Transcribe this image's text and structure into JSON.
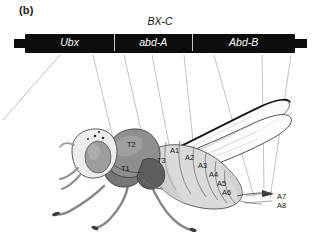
{
  "figure": {
    "panel_label": "(b)",
    "complex_title": "BX-C",
    "caption_alt": "Bithorax complex gene map aligned to Drosophila body segments"
  },
  "gene_bar": {
    "background_color": "#0d0d0d",
    "text_color": "#ffffff",
    "divider_color": "#c9c9c9",
    "genes": [
      {
        "name": "Ubx",
        "left_pct": 0.0,
        "width_pct": 33.0
      },
      {
        "name": "abd-A",
        "left_pct": 33.0,
        "width_pct": 29.0
      },
      {
        "name": "Abd-B",
        "left_pct": 62.0,
        "width_pct": 38.0
      }
    ]
  },
  "fly": {
    "body_outline_color": "#3a3a3a",
    "thorax_fill": "#8e8e8e",
    "abdomen_fill": "#d6d6d6",
    "head_fill": "#e8e8e8",
    "eye_fill": "#9a9a9a",
    "wing_stroke": "#5a5a5a",
    "segments": [
      {
        "label": "T1",
        "x": 121,
        "y": 164
      },
      {
        "label": "T2",
        "x": 127,
        "y": 140
      },
      {
        "label": "T3",
        "x": 157,
        "y": 156
      },
      {
        "label": "A1",
        "x": 170,
        "y": 146
      },
      {
        "label": "A2",
        "x": 185,
        "y": 153
      },
      {
        "label": "A3",
        "x": 198,
        "y": 161
      },
      {
        "label": "A4",
        "x": 209,
        "y": 170
      },
      {
        "label": "A5",
        "x": 217,
        "y": 179
      },
      {
        "label": "A6",
        "x": 222,
        "y": 188
      },
      {
        "label": "A7",
        "x": 277,
        "y": 192
      },
      {
        "label": "A8",
        "x": 277,
        "y": 201
      }
    ]
  },
  "connectors": {
    "stroke_color": "#8a8a8a",
    "lines": [
      {
        "x1": 60,
        "y1": 55,
        "x2": 2,
        "y2": 118
      },
      {
        "x1": 92,
        "y1": 55,
        "x2": 118,
        "y2": 160
      },
      {
        "x1": 122,
        "y1": 55,
        "x2": 148,
        "y2": 168
      },
      {
        "x1": 152,
        "y1": 55,
        "x2": 168,
        "y2": 152
      },
      {
        "x1": 183,
        "y1": 55,
        "x2": 196,
        "y2": 186
      },
      {
        "x1": 213,
        "y1": 55,
        "x2": 252,
        "y2": 196
      },
      {
        "x1": 262,
        "y1": 55,
        "x2": 262,
        "y2": 190
      },
      {
        "x1": 290,
        "y1": 55,
        "x2": 268,
        "y2": 198
      }
    ]
  }
}
